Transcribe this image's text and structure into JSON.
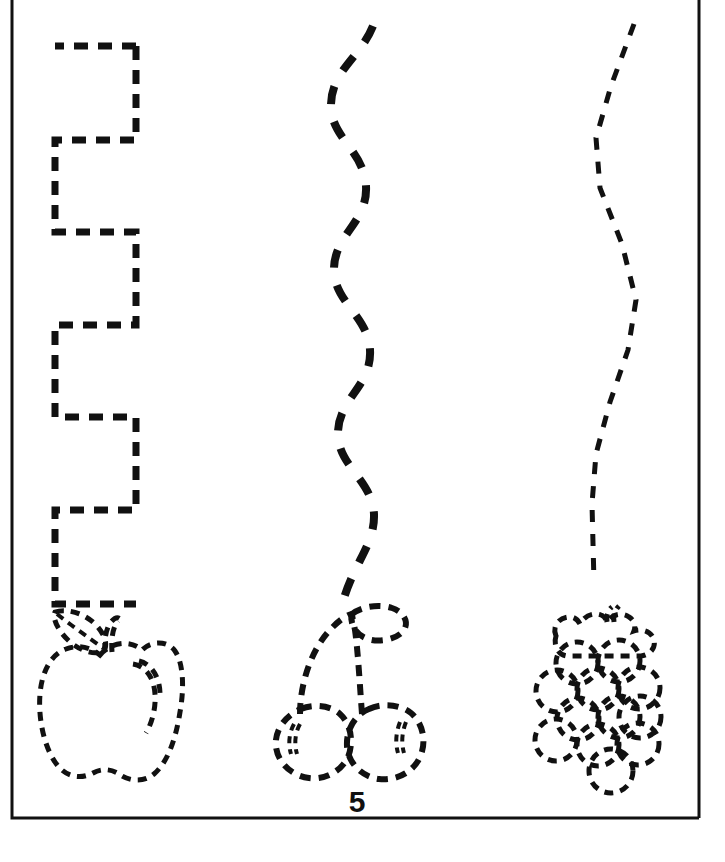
{
  "worksheet": {
    "title": "Fruit tracing worksheet",
    "page_number": "5",
    "background_color": "#ffffff",
    "ink_color": "#111111",
    "border": {
      "name": "worksheet-frame",
      "left": 12,
      "top": 0,
      "right": 699,
      "bottom": 818,
      "stroke_width": 3
    },
    "columns": [
      {
        "id": "apple",
        "label": "apple",
        "path_name": "square-wave-trace-path",
        "path_style": "square-wave",
        "fruit_name": "apple-outline",
        "dash_pattern": "14 10",
        "stroke_width": 7
      },
      {
        "id": "cherries",
        "label": "cherries",
        "path_name": "wavy-trace-path",
        "path_style": "wave",
        "fruit_name": "cherries-outline",
        "dash_pattern": "18 18",
        "stroke_width": 8
      },
      {
        "id": "grapes",
        "label": "grapes",
        "path_name": "zigzag-trace-path",
        "path_style": "zigzag",
        "fruit_name": "grapes-outline",
        "dash_pattern": "12 12",
        "stroke_width": 5
      }
    ]
  }
}
